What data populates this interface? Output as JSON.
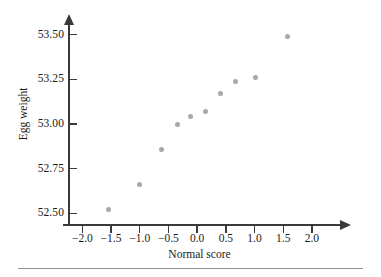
{
  "chart_data": {
    "type": "scatter",
    "title": "",
    "xlabel": "Normal score",
    "ylabel": "Egg weight",
    "xlim": [
      -2.25,
      2.35
    ],
    "ylim": [
      52.44,
      53.56
    ],
    "xticks": [
      "-2.0",
      "-1.5",
      "-1.0",
      "-0.5",
      "0.0",
      "0.5",
      "1.0",
      "1.5",
      "2.0"
    ],
    "xtick_values": [
      -2.0,
      -1.5,
      -1.0,
      -0.5,
      0.0,
      0.5,
      1.0,
      1.5,
      2.0
    ],
    "yticks": [
      "52.50",
      "52.75",
      "53.00",
      "53.25",
      "53.50"
    ],
    "ytick_values": [
      52.5,
      52.75,
      53.0,
      53.25,
      53.5
    ],
    "grid": false,
    "legend": false,
    "marker_color": "#a8a8a8",
    "axis_color": "#3a3a3a",
    "x": [
      -1.54,
      -1.0,
      -0.62,
      -0.35,
      -0.11,
      0.15,
      0.4,
      0.67,
      1.01,
      1.57
    ],
    "y": [
      52.52,
      52.66,
      52.86,
      53.0,
      53.04,
      53.07,
      53.17,
      53.24,
      53.26,
      53.49
    ],
    "points": [
      {
        "x": -1.54,
        "y": 52.52
      },
      {
        "x": -1.0,
        "y": 52.66
      },
      {
        "x": -0.62,
        "y": 52.86
      },
      {
        "x": -0.35,
        "y": 53.0
      },
      {
        "x": -0.11,
        "y": 53.04
      },
      {
        "x": 0.15,
        "y": 53.07
      },
      {
        "x": 0.4,
        "y": 53.17
      },
      {
        "x": 0.67,
        "y": 53.24
      },
      {
        "x": 1.01,
        "y": 53.26
      },
      {
        "x": 1.57,
        "y": 53.49
      }
    ]
  }
}
